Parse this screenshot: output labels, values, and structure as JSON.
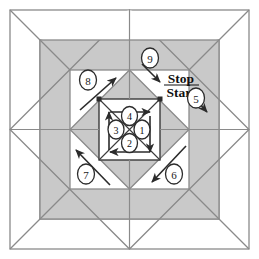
{
  "figure": {
    "type": "diagram",
    "width": 259,
    "height": 259
  },
  "colors": {
    "background": "#ffffff",
    "shaded_fill": "#c9c9c9",
    "line": "#8a8a8a",
    "dark_line": "#3a3a3a",
    "arrow": "#2b2b2b",
    "text": "#111111",
    "circle_stroke": "#2b2b2b",
    "circle_fill": "#ffffff"
  },
  "labels": {
    "stop": "Stop",
    "start": "Start"
  },
  "outer_steps": [
    {
      "id": "step-5",
      "number": "5",
      "cx": 196,
      "cy": 98
    },
    {
      "id": "step-6",
      "number": "6",
      "cx": 174,
      "cy": 174
    },
    {
      "id": "step-7",
      "number": "7",
      "cx": 86,
      "cy": 174
    },
    {
      "id": "step-8",
      "number": "8",
      "cx": 88,
      "cy": 80
    },
    {
      "id": "step-9",
      "number": "9",
      "cx": 150,
      "cy": 58
    }
  ],
  "inner_steps": [
    {
      "id": "step-1",
      "number": "1",
      "cx": 142,
      "cy": 129
    },
    {
      "id": "step-2",
      "number": "2",
      "cx": 129,
      "cy": 143
    },
    {
      "id": "step-3",
      "number": "3",
      "cx": 116,
      "cy": 129
    },
    {
      "id": "step-4",
      "number": "4",
      "cx": 129,
      "cy": 116
    }
  ],
  "geometry": {
    "outer_square": {
      "x": 10,
      "y": 10,
      "size": 239
    },
    "shaded_square": {
      "x": 40,
      "y": 40,
      "size": 179
    },
    "inner_white_square": {
      "x": 70,
      "y": 70,
      "size": 119
    },
    "center_square": {
      "x": 99,
      "y": 99,
      "size": 61
    },
    "center": {
      "x": 129.5,
      "y": 129.5
    }
  }
}
